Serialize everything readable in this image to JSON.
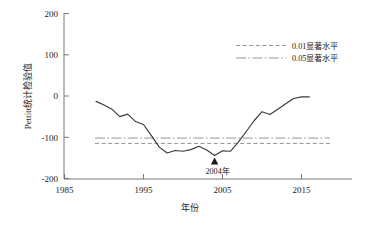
{
  "chart_data": {
    "type": "line",
    "title": "",
    "xlabel": "年份",
    "ylabel": "Pettitt统计检验值",
    "xlim": [
      1985,
      2018
    ],
    "ylim": [
      -200,
      200
    ],
    "xticks": [
      1985,
      1995,
      2005,
      2015
    ],
    "xtick_labels": [
      "1985",
      "1995",
      "2005",
      "2015"
    ],
    "yticks": [
      200,
      100,
      0,
      -100,
      -200
    ],
    "ytick_labels": [
      "200",
      "100",
      "0",
      "-100",
      "-200"
    ],
    "grid": false,
    "legend_position": "upper-right",
    "series": [
      {
        "name": "Pettitt统计检验值",
        "style": "solid",
        "color": "#3a3a3a",
        "x": [
          1989,
          1990,
          1991,
          1992,
          1993,
          1994,
          1995,
          1996,
          1997,
          1998,
          1999,
          2000,
          2001,
          2002,
          2003,
          2004,
          2005,
          2006,
          2007,
          2008,
          2009,
          2010,
          2011,
          2012,
          2013,
          2014,
          2015,
          2016
        ],
        "values": [
          -13,
          -22,
          -32,
          -50,
          -44,
          -62,
          -69,
          -96,
          -124,
          -138,
          -132,
          -134,
          -130,
          -122,
          -131,
          -144,
          -133,
          -134,
          -112,
          -86,
          -60,
          -38,
          -45,
          -32,
          -19,
          -6,
          -2,
          -2
        ]
      }
    ],
    "hlines": [
      {
        "name": "0.01显著水平",
        "y": -115,
        "style": "dashed",
        "color": "#8a8a8a"
      },
      {
        "name": "0.05显著水平",
        "y": -102,
        "style": "dash-dot",
        "color": "#8a8a8a"
      }
    ],
    "annotations": [
      {
        "text": "2004年",
        "x": 2004,
        "y": -144,
        "marker": "triangle-up"
      }
    ],
    "legend": [
      {
        "label": "0.01显著水平",
        "style": "dashed",
        "color": "#8a8a8a"
      },
      {
        "label": "0.05显著水平",
        "style": "dash-dot",
        "color": "#8a8a8a"
      }
    ]
  }
}
